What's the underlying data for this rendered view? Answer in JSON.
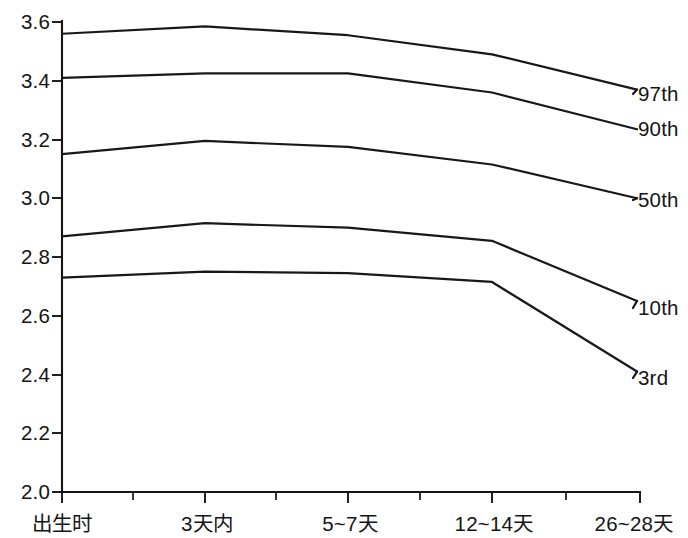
{
  "chart_data": {
    "type": "line",
    "title": "",
    "subtitle": "",
    "xlabel": "",
    "ylabel": "",
    "grid": false,
    "legend_position": "right-inline-labels",
    "categories": [
      "出生时",
      "3天内",
      "5~7天",
      "12~14天",
      "26~28天"
    ],
    "x_tick_labels": [
      "出生时",
      "3天内",
      "5~7天",
      "12~14天",
      "26~28天"
    ],
    "y_tick_labels": [
      "3.6",
      "3.4",
      "3.2",
      "3.0",
      "2.8",
      "2.6",
      "2.4",
      "2.2",
      "2.0"
    ],
    "y_tick_values": [
      3.6,
      3.4,
      3.2,
      3.0,
      2.8,
      2.6,
      2.4,
      2.2,
      2.0
    ],
    "ylim": [
      2.0,
      3.6
    ],
    "series": [
      {
        "name": "97th",
        "values": [
          3.56,
          3.585,
          3.555,
          3.49,
          3.37
        ]
      },
      {
        "name": "90th",
        "values": [
          3.41,
          3.425,
          3.425,
          3.36,
          3.235
        ]
      },
      {
        "name": "50th",
        "values": [
          3.15,
          3.195,
          3.175,
          3.115,
          3.0
        ]
      },
      {
        "name": "10th",
        "values": [
          2.87,
          2.915,
          2.9,
          2.855,
          2.65
        ]
      },
      {
        "name": "3rd",
        "values": [
          2.73,
          2.75,
          2.745,
          2.715,
          2.41
        ]
      }
    ],
    "series_labels": [
      "97th",
      "90th",
      "50th",
      "10th",
      "3rd"
    ],
    "line_color": "#18181a",
    "axis_color": "#141414",
    "background_color": "#ffffff"
  },
  "axis": {
    "y_labels": [
      "3.6",
      "3.4",
      "3.2",
      "3.0",
      "2.8",
      "2.6",
      "2.4",
      "2.2",
      "2.0"
    ],
    "x_labels": [
      "出生时",
      "3天内",
      "5~7天",
      "12~14天",
      "26~28天"
    ]
  },
  "legend": {
    "labels": [
      "97th",
      "90th",
      "50th",
      "10th",
      "3rd"
    ]
  }
}
